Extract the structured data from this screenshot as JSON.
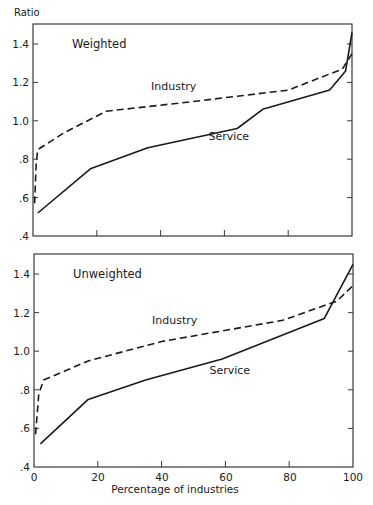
{
  "figure": {
    "y_axis_label": "Ratio",
    "x_axis_label": "Percentage of industries",
    "x_tick_labels": [
      "0",
      "20",
      "40",
      "60",
      "80",
      "100"
    ],
    "y_tick_labels": [
      ".4",
      ".6",
      ".8",
      "1.0",
      "1.2",
      "1.4"
    ]
  },
  "chart_data": [
    {
      "type": "line",
      "title": "Weighted",
      "xlabel": "Percentage of industries",
      "ylabel": "Ratio",
      "xlim": [
        0,
        100
      ],
      "ylim": [
        0.4,
        1.5
      ],
      "x_ticks": [
        0,
        20,
        40,
        60,
        80,
        100
      ],
      "y_ticks": [
        0.4,
        0.6,
        0.8,
        1.0,
        1.2,
        1.4
      ],
      "grid": false,
      "legend": "inline labels",
      "series": [
        {
          "name": "Industry",
          "style": "dashed",
          "label_pos": [
            37,
            1.16
          ],
          "points": [
            [
              0.5,
              0.57
            ],
            [
              1,
              0.78
            ],
            [
              1.5,
              0.85
            ],
            [
              10,
              0.94
            ],
            [
              23,
              1.05
            ],
            [
              50,
              1.1
            ],
            [
              80,
              1.16
            ],
            [
              97,
              1.27
            ],
            [
              100,
              1.35
            ]
          ]
        },
        {
          "name": "Service",
          "style": "solid",
          "label_pos": [
            55,
            0.9
          ],
          "points": [
            [
              1.5,
              0.52
            ],
            [
              18,
              0.75
            ],
            [
              36,
              0.86
            ],
            [
              64,
              0.96
            ],
            [
              72,
              1.06
            ],
            [
              93,
              1.16
            ],
            [
              98,
              1.26
            ],
            [
              100,
              1.46
            ]
          ]
        }
      ]
    },
    {
      "type": "line",
      "title": "Unweighted",
      "xlabel": "Percentage of industries",
      "ylabel": "Ratio",
      "xlim": [
        0,
        100
      ],
      "ylim": [
        0.4,
        1.5
      ],
      "x_ticks": [
        0,
        20,
        40,
        60,
        80,
        100
      ],
      "y_ticks": [
        0.4,
        0.6,
        0.8,
        1.0,
        1.2,
        1.4
      ],
      "grid": false,
      "legend": "inline labels",
      "series": [
        {
          "name": "Industry",
          "style": "dashed",
          "label_pos": [
            37,
            1.14
          ],
          "points": [
            [
              0.5,
              0.57
            ],
            [
              1.5,
              0.78
            ],
            [
              3,
              0.85
            ],
            [
              17,
              0.95
            ],
            [
              40,
              1.05
            ],
            [
              78,
              1.16
            ],
            [
              95,
              1.26
            ],
            [
              100,
              1.34
            ]
          ]
        },
        {
          "name": "Service",
          "style": "solid",
          "label_pos": [
            55,
            0.88
          ],
          "points": [
            [
              2,
              0.52
            ],
            [
              17,
              0.75
            ],
            [
              35,
              0.85
            ],
            [
              59,
              0.96
            ],
            [
              91,
              1.17
            ],
            [
              100,
              1.45
            ]
          ]
        }
      ]
    }
  ]
}
